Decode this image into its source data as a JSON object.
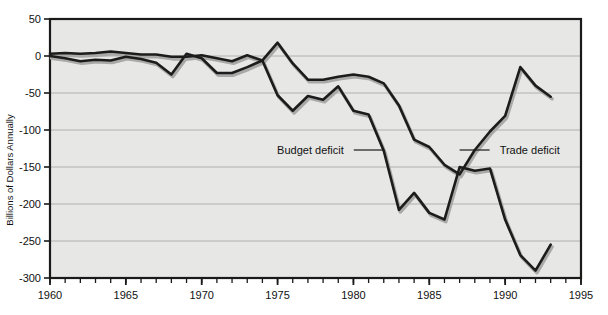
{
  "figure": {
    "background": "#ffffff",
    "plot_background": "#e7e7e5",
    "frame_color": "#1a1a1a",
    "grid_color": "#9a9a98",
    "line_color": "#1c1c1c",
    "shadow_color": "#a9a9a7"
  },
  "chart_data": {
    "type": "line",
    "title": "",
    "xlabel": "",
    "ylabel": "Billions of Dollars Annually",
    "xlim": [
      1960,
      1995
    ],
    "ylim": [
      -300,
      50
    ],
    "xticks": [
      1960,
      1965,
      1970,
      1975,
      1980,
      1985,
      1990,
      1995
    ],
    "xtick_labels": [
      "1960",
      "1965",
      "1970",
      "1975",
      "1980",
      "1985",
      "1990",
      "1995"
    ],
    "minor_xtick_interval": 1,
    "yticks": [
      50,
      0,
      -50,
      -100,
      -150,
      -200,
      -250,
      -300
    ],
    "ytick_labels": [
      "50",
      "0",
      "-50",
      "-100",
      "-150",
      "-200",
      "-250",
      "-300"
    ],
    "grid": true,
    "grid_axis": "y",
    "legend": "annotations-with-leader-lines",
    "series": [
      {
        "name": "Budget deficit",
        "x": [
          1960,
          1961,
          1962,
          1963,
          1964,
          1965,
          1966,
          1967,
          1968,
          1969,
          1970,
          1971,
          1972,
          1973,
          1974,
          1975,
          1976,
          1977,
          1978,
          1979,
          1980,
          1981,
          1982,
          1983,
          1984,
          1985,
          1986,
          1987,
          1988,
          1989,
          1990,
          1991,
          1992,
          1993
        ],
        "values": [
          0,
          -3,
          -7,
          -5,
          -6,
          -1,
          -4,
          -9,
          -25,
          3,
          -3,
          -23,
          -23,
          -15,
          -6,
          -53,
          -74,
          -54,
          -59,
          -41,
          -74,
          -79,
          -128,
          -208,
          -185,
          -212,
          -221,
          -150,
          -155,
          -152,
          -221,
          -269,
          -290,
          -255
        ]
      },
      {
        "name": "Trade deficit",
        "x": [
          1960,
          1961,
          1962,
          1963,
          1964,
          1965,
          1966,
          1967,
          1968,
          1969,
          1970,
          1971,
          1972,
          1973,
          1974,
          1975,
          1976,
          1977,
          1978,
          1979,
          1980,
          1981,
          1982,
          1983,
          1984,
          1985,
          1986,
          1987,
          1988,
          1989,
          1990,
          1991,
          1992,
          1993
        ],
        "values": [
          3,
          4,
          3,
          4,
          6,
          4,
          2,
          2,
          -1,
          -1,
          1,
          -3,
          -7,
          1,
          -6,
          18,
          -10,
          -32,
          -32,
          -28,
          -25,
          -28,
          -37,
          -67,
          -113,
          -123,
          -147,
          -160,
          -127,
          -102,
          -81,
          -15,
          -40,
          -55
        ]
      }
    ],
    "annotations": [
      {
        "text": "Budget deficit",
        "points_to_series": "Budget deficit",
        "points_to_x": 1982,
        "points_to_y": -128
      },
      {
        "text": "Trade deficit",
        "points_to_series": "Trade deficit",
        "points_to_x": 1987,
        "points_to_y": -160
      }
    ]
  }
}
